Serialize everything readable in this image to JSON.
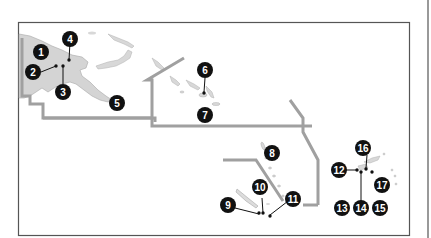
{
  "map": {
    "colors": {
      "land": "#d4d4d4",
      "land_stroke": "#a8a8a8",
      "boundary": "#9e9e9e",
      "frame": "#555555",
      "marker": "#111111",
      "marker_text": "#ffffff"
    },
    "markers": [
      {
        "id": "1",
        "label": "1"
      },
      {
        "id": "2",
        "label": "2"
      },
      {
        "id": "3",
        "label": "3"
      },
      {
        "id": "4",
        "label": "4"
      },
      {
        "id": "5",
        "label": "5"
      },
      {
        "id": "6",
        "label": "6"
      },
      {
        "id": "7",
        "label": "7"
      },
      {
        "id": "8",
        "label": "8"
      },
      {
        "id": "9",
        "label": "9"
      },
      {
        "id": "10",
        "label": "10"
      },
      {
        "id": "11",
        "label": "11"
      },
      {
        "id": "12",
        "label": "12"
      },
      {
        "id": "13",
        "label": "13"
      },
      {
        "id": "14",
        "label": "14"
      },
      {
        "id": "15",
        "label": "15"
      },
      {
        "id": "16",
        "label": "16"
      },
      {
        "id": "17",
        "label": "17"
      }
    ]
  }
}
